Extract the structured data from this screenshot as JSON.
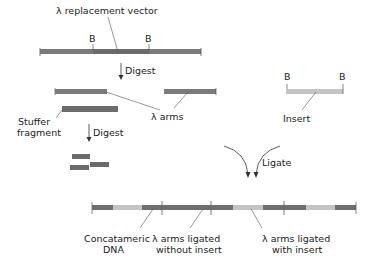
{
  "diagram": {
    "title": "",
    "colors": {
      "arm": "#7a7a7a",
      "stuffer": "#6e6e6e",
      "insert": "#c4c4c4",
      "tick": "#555555",
      "leader": "#555555",
      "text": "#222222"
    },
    "labels": {
      "vector": "λ replacement vector",
      "bamhi_site": "B",
      "digest_1": "Digest",
      "digest_2": "Digest",
      "stuffer_line1": "Stuffer",
      "stuffer_line2": "fragment",
      "lambda_arms": "λ arms",
      "insert": "Insert",
      "ligate": "Ligate",
      "concat_line1": "Concatameric",
      "concat_line2": "DNA",
      "without_line1": "λ arms ligated",
      "without_line2": "without insert",
      "with_line1": "λ arms ligated",
      "with_line2": "with insert"
    },
    "steps": [
      "λ replacement vector",
      "Digest",
      "λ arms + Stuffer fragment",
      "Digest stuffer",
      "Ligate with Insert",
      "Concatameric DNA"
    ]
  }
}
